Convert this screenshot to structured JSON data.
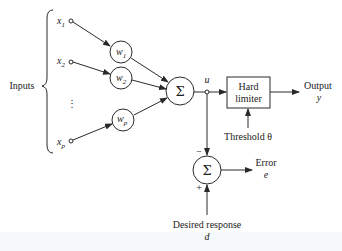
{
  "diagram": {
    "inputs_label": "Inputs",
    "inputs": [
      {
        "base": "x",
        "sub": "1"
      },
      {
        "base": "x",
        "sub": "2"
      },
      {
        "base": "x",
        "sub": "p"
      }
    ],
    "ellipsis": "⋮",
    "weights": [
      {
        "base": "w",
        "sub": "1"
      },
      {
        "base": "w",
        "sub": "2"
      },
      {
        "base": "w",
        "sub": "p"
      }
    ],
    "summer_symbol": "Σ",
    "summer_output_label": "u",
    "limiter": {
      "line1": "Hard",
      "line2": "limiter"
    },
    "threshold_label": "Threshold θ",
    "output": {
      "label": "Output",
      "symbol": "y"
    },
    "error_summer": {
      "symbol": "Σ",
      "minus": "−",
      "plus": "+"
    },
    "error": {
      "label": "Error",
      "symbol": "e"
    },
    "desired": {
      "label": "Desired response",
      "symbol": "d"
    },
    "colors": {
      "stroke": "#2a2a2a",
      "text": "#222222",
      "background": "#ffffff"
    }
  }
}
